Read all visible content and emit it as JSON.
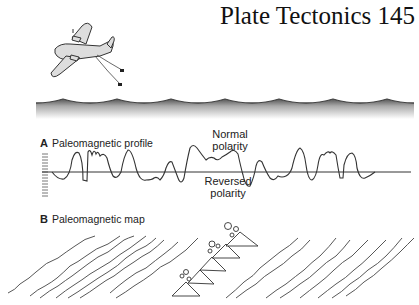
{
  "page": {
    "header_title": "Plate Tectonics",
    "page_number": "145"
  },
  "illustration": {
    "aircraft": "airplane-with-towed-magnetometer",
    "surface": "ocean-waves"
  },
  "panel_a": {
    "letter": "A",
    "title": "Paleomagnetic profile",
    "normal_label_line1": "Normal",
    "normal_label_line2": "polarity",
    "reversed_label_line1": "Reversed",
    "reversed_label_line2": "polarity"
  },
  "panel_b": {
    "letter": "B",
    "title": "Paleomagnetic map",
    "feature": "mid-ocean-ridge-volcanoes"
  },
  "colors": {
    "line": "#333333",
    "airplane_fill": "#dddddd",
    "wave_top": "#555555",
    "wave_fade": "#ffffff"
  }
}
